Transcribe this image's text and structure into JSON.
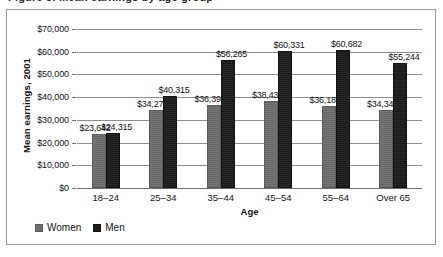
{
  "above_caption": "Figure 3. Mean earnings by age group",
  "chart_data": {
    "type": "bar",
    "title": "",
    "xlabel": "Age",
    "ylabel": "Mean earnings, 2001",
    "categories": [
      "18–24",
      "25–34",
      "35–44",
      "45–54",
      "55–64",
      "Over 65"
    ],
    "series": [
      {
        "name": "Women",
        "color": "#6f6f6f",
        "values": [
          23642,
          34273,
          36395,
          38439,
          36189,
          34343
        ],
        "labels": [
          "$23,642",
          "$34,273",
          "$36,395",
          "$38,439",
          "$36,189",
          "$34,343"
        ]
      },
      {
        "name": "Men",
        "color": "#1d1d1d",
        "values": [
          24315,
          40315,
          56265,
          60331,
          60682,
          55244
        ],
        "labels": [
          "$24,315",
          "$40,315",
          "$56,265",
          "$60,331",
          "$60,682",
          "$55,244"
        ]
      }
    ],
    "ylim": [
      0,
      70000
    ],
    "yticks": [
      0,
      10000,
      20000,
      30000,
      40000,
      50000,
      60000,
      70000
    ],
    "ytick_labels": [
      "$0",
      "$10,000",
      "$20,000",
      "$30,000",
      "$40,000",
      "$50,000",
      "$60,000",
      "$70,000"
    ],
    "grid": true,
    "legend_position": "bottom-left",
    "legend": [
      "Women",
      "Men"
    ]
  }
}
